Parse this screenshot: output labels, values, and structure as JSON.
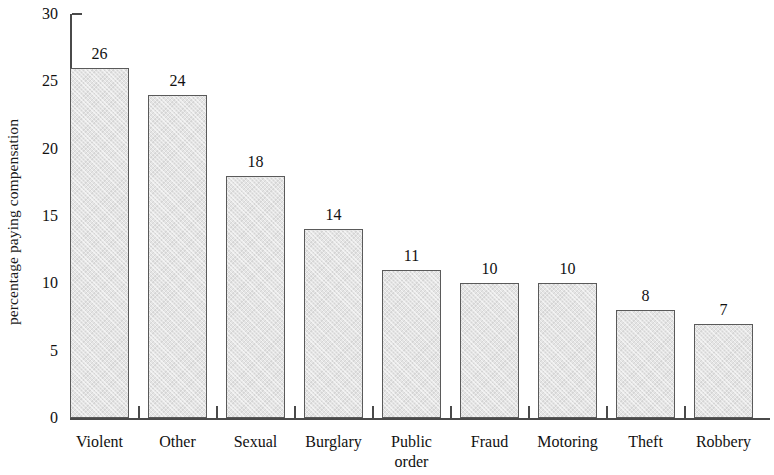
{
  "chart_data": {
    "type": "bar",
    "title": "",
    "subtitle": "",
    "xlabel": "",
    "ylabel": "percentage paying compensation",
    "categories": [
      "Violent",
      "Other",
      "Sexual",
      "Burglary",
      "Public order",
      "Fraud",
      "Motoring",
      "Theft",
      "Robbery"
    ],
    "category_lines": [
      [
        "Violent"
      ],
      [
        "Other"
      ],
      [
        "Sexual"
      ],
      [
        "Burglary"
      ],
      [
        "Public",
        "order"
      ],
      [
        "Fraud"
      ],
      [
        "Motoring"
      ],
      [
        "Theft"
      ],
      [
        "Robbery"
      ]
    ],
    "values": [
      26,
      24,
      18,
      14,
      11,
      10,
      10,
      8,
      7
    ],
    "value_labels": [
      "26",
      "24",
      "18",
      "14",
      "11",
      "10",
      "10",
      "8",
      "7"
    ],
    "ylim": [
      0,
      30
    ],
    "yticks": [
      0,
      5,
      10,
      15,
      20,
      25,
      30
    ],
    "ytick_labels": [
      "0",
      "5",
      "10",
      "15",
      "20",
      "25",
      "30"
    ],
    "grid": false,
    "legend": null,
    "bar_color": "#e4e4e4",
    "bar_border_color": "#5a5a5a",
    "axis_color": "#4a4a4a",
    "text_color": "#111111"
  }
}
